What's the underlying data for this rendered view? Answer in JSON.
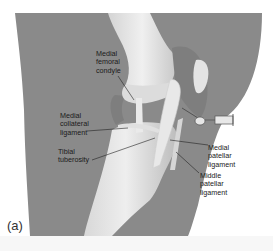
{
  "figure": {
    "panel_label": "(a)",
    "colors": {
      "background": "#ffffff",
      "soft_tissue": "#8a8a8a",
      "bone": "#e6e6e6",
      "bone_shadow": "#bdbdbd",
      "joint_capsule": "#9c9c9c",
      "label_text": "#1a1a1a",
      "leader_line": "#222222"
    },
    "labels": [
      {
        "id": "medial-femoral-condyle",
        "text": "Medial\nfemoral\ncondyle"
      },
      {
        "id": "medial-collateral-ligament",
        "text": "Medial\ncollateral\nligament"
      },
      {
        "id": "tibial-tuberosity",
        "text": "Tibial\ntuberosity"
      },
      {
        "id": "medial-patellar-ligament",
        "text": "Medial\npatellar\nligament"
      },
      {
        "id": "middle-patellar-ligament",
        "text": "Middle\npatellar\nligament"
      }
    ],
    "instrument": "needle-and-syringe"
  }
}
